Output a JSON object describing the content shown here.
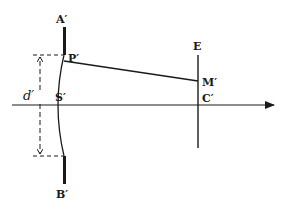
{
  "diagram": {
    "labels": {
      "A": "A′",
      "P": "P′",
      "S": "S′",
      "B": "B′",
      "E": "E",
      "M": "M′",
      "C": "C′",
      "d": "d′"
    },
    "colors": {
      "ink": "#1a1a1a",
      "background": "#ffffff"
    }
  }
}
